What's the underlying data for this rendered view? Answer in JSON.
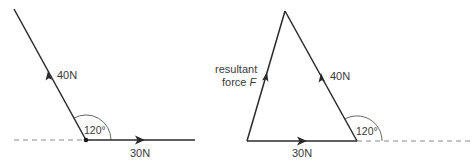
{
  "left_diagram": {
    "force_a": {
      "label": "40N",
      "direction": "up-left"
    },
    "force_b": {
      "label": "30N",
      "direction": "right"
    },
    "angle": {
      "label": "120°"
    }
  },
  "right_diagram": {
    "resultant": {
      "label_line1": "resultant",
      "label_line2": "force ",
      "label_symbol": "F"
    },
    "force_a": {
      "label": "40N"
    },
    "force_b": {
      "label": "30N"
    },
    "angle": {
      "label": "120°"
    }
  },
  "colors": {
    "line": "#2a2a2a",
    "dashed": "#8a8a8a",
    "text": "#3a3a3a"
  }
}
